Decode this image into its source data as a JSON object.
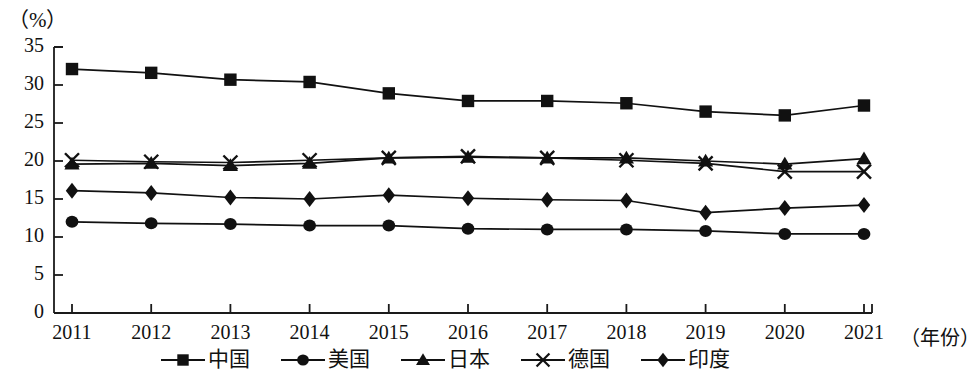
{
  "chart_data": {
    "type": "line",
    "title": "",
    "xlabel": "（年份）",
    "ylabel": "（%）",
    "ylim": [
      0,
      35
    ],
    "ytick_step": 5,
    "grid": false,
    "legend_position": "bottom",
    "axis_color": "#1a1a1a",
    "series_color": "#111111",
    "categories": [
      "2011",
      "2012",
      "2013",
      "2014",
      "2015",
      "2016",
      "2017",
      "2018",
      "2019",
      "2020",
      "2021"
    ],
    "yticks": [
      "0",
      "5",
      "10",
      "15",
      "20",
      "25",
      "30",
      "35"
    ],
    "series": [
      {
        "name": "中国",
        "marker": "square",
        "values": [
          32.1,
          31.6,
          30.7,
          30.4,
          28.9,
          27.9,
          27.9,
          27.6,
          26.5,
          26.0,
          27.3
        ]
      },
      {
        "name": "美国",
        "marker": "circle",
        "values": [
          12.0,
          11.8,
          11.7,
          11.5,
          11.5,
          11.1,
          11.0,
          11.0,
          10.8,
          10.4,
          10.4
        ]
      },
      {
        "name": "日本",
        "marker": "triangle",
        "values": [
          19.6,
          19.7,
          19.4,
          19.7,
          20.4,
          20.5,
          20.4,
          20.4,
          20.0,
          19.6,
          20.3
        ]
      },
      {
        "name": "德国",
        "marker": "cross",
        "values": [
          20.1,
          19.9,
          19.8,
          20.1,
          20.4,
          20.6,
          20.4,
          20.1,
          19.7,
          18.6,
          18.6
        ]
      },
      {
        "name": "印度",
        "marker": "diamond",
        "values": [
          16.1,
          15.8,
          15.2,
          15.0,
          15.5,
          15.1,
          14.9,
          14.8,
          13.2,
          13.8,
          14.2
        ]
      }
    ]
  },
  "legend": {
    "items": [
      {
        "label": "中国",
        "marker": "square"
      },
      {
        "label": "美国",
        "marker": "circle"
      },
      {
        "label": "日本",
        "marker": "triangle"
      },
      {
        "label": "德国",
        "marker": "cross"
      },
      {
        "label": "印度",
        "marker": "diamond"
      }
    ]
  }
}
